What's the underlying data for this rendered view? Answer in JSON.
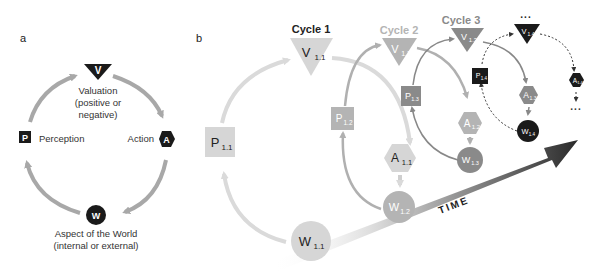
{
  "panel_a": {
    "label": "a",
    "nodes": {
      "valuation": {
        "glyph": "V",
        "caption_lines": [
          "Valuation",
          "(positive or",
          "negative)"
        ]
      },
      "action": {
        "glyph": "A",
        "caption": "Action"
      },
      "world": {
        "glyph": "W",
        "caption_lines": [
          "Aspect of the World",
          "(internal or external)"
        ]
      },
      "perception": {
        "glyph": "P",
        "caption": "Perception"
      }
    }
  },
  "panel_b": {
    "label": "b",
    "cycles": [
      {
        "title": "Cycle 1",
        "V": "V",
        "V_sub": "1.1",
        "A": "A",
        "A_sub": "1.1",
        "W": "W",
        "W_sub": "1.1",
        "P": "P",
        "P_sub": "1.1"
      },
      {
        "title": "Cycle 2",
        "V": "V",
        "V_sub": "1.2",
        "A": "A",
        "A_sub": "1.2",
        "W": "W",
        "W_sub": "1.2",
        "P": "P",
        "P_sub": "1.2"
      },
      {
        "title": "Cycle 3",
        "V": "V",
        "V_sub": "1.3",
        "A": "A",
        "A_sub": "1.3",
        "W": "W",
        "W_sub": "1.3",
        "P": "P",
        "P_sub": "1.3"
      },
      {
        "title": "...",
        "V": "V",
        "V_sub": "1.4",
        "A": "A",
        "A_sub": "1.4",
        "W": "W",
        "W_sub": "1.4",
        "P": "P",
        "P_sub": "1.4"
      }
    ],
    "continuation": "...",
    "time_label": "TIME"
  },
  "colors": {
    "black": "#1a1a1a",
    "cycle1": "#d6d6d6",
    "cycle2": "#b4b4b4",
    "cycle3": "#8a8a8a",
    "cycle4": "#1a1a1a",
    "arrow_a": "#a8a8a8"
  }
}
